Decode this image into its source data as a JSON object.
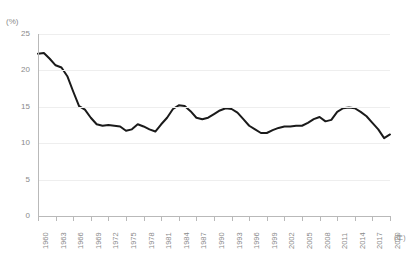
{
  "chart_title": "",
  "axes": {
    "y_unit": "(%)",
    "x_unit": "(年)",
    "y_ticks": [
      25,
      20,
      15,
      10,
      5,
      0
    ],
    "x_tick_labels": [
      "1960",
      "1963",
      "1966",
      "1969",
      "1972",
      "1975",
      "1978",
      "1981",
      "1984",
      "1987",
      "1990",
      "1993",
      "1996",
      "1999",
      "2002",
      "2005",
      "2008",
      "2011",
      "2014",
      "2017",
      "2020"
    ]
  },
  "style": {
    "line_color": "#1a1a1a",
    "grid_color": "#eeeeee",
    "axis_color": "#b9b9b9",
    "text_color": "#8a8a8a",
    "background": "#ffffff"
  },
  "chart_data": {
    "type": "line",
    "title": "",
    "xlabel": "(年)",
    "ylabel": "(%)",
    "xlim": [
      1960,
      2020
    ],
    "ylim": [
      0,
      25
    ],
    "grid": true,
    "legend": "none",
    "x": [
      1960,
      1961,
      1962,
      1963,
      1964,
      1965,
      1966,
      1967,
      1968,
      1969,
      1970,
      1971,
      1972,
      1973,
      1974,
      1975,
      1976,
      1977,
      1978,
      1979,
      1980,
      1981,
      1982,
      1983,
      1984,
      1985,
      1986,
      1987,
      1988,
      1989,
      1990,
      1991,
      1992,
      1993,
      1994,
      1995,
      1996,
      1997,
      1998,
      1999,
      2000,
      2001,
      2002,
      2003,
      2004,
      2005,
      2006,
      2007,
      2008,
      2009,
      2010,
      2011,
      2012,
      2013,
      2014,
      2015,
      2016,
      2017,
      2018,
      2019,
      2020
    ],
    "values": [
      22.3,
      22.4,
      21.6,
      20.7,
      20.4,
      19.2,
      17.1,
      15.1,
      14.6,
      13.5,
      12.6,
      12.4,
      12.5,
      12.4,
      12.3,
      11.7,
      11.9,
      12.6,
      12.3,
      11.9,
      11.6,
      12.6,
      13.5,
      14.7,
      15.2,
      15.1,
      14.4,
      13.5,
      13.3,
      13.5,
      14.0,
      14.5,
      14.8,
      14.7,
      14.2,
      13.3,
      12.4,
      11.9,
      11.4,
      11.4,
      11.8,
      12.1,
      12.3,
      12.3,
      12.4,
      12.4,
      12.8,
      13.3,
      13.6,
      13.0,
      13.2,
      14.3,
      14.8,
      14.9,
      14.8,
      14.3,
      13.7,
      12.8,
      11.9,
      10.7,
      11.2
    ],
    "series": [
      {
        "name": "割合",
        "values": [
          22.3,
          22.4,
          21.6,
          20.7,
          20.4,
          19.2,
          17.1,
          15.1,
          14.6,
          13.5,
          12.6,
          12.4,
          12.5,
          12.4,
          12.3,
          11.7,
          11.9,
          12.6,
          12.3,
          11.9,
          11.6,
          12.6,
          13.5,
          14.7,
          15.2,
          15.1,
          14.4,
          13.5,
          13.3,
          13.5,
          14.0,
          14.5,
          14.8,
          14.7,
          14.2,
          13.3,
          12.4,
          11.9,
          11.4,
          11.4,
          11.8,
          12.1,
          12.3,
          12.3,
          12.4,
          12.4,
          12.8,
          13.3,
          13.6,
          13.0,
          13.2,
          14.3,
          14.8,
          14.9,
          14.8,
          14.3,
          13.7,
          12.8,
          11.9,
          10.7,
          11.2
        ]
      }
    ]
  }
}
